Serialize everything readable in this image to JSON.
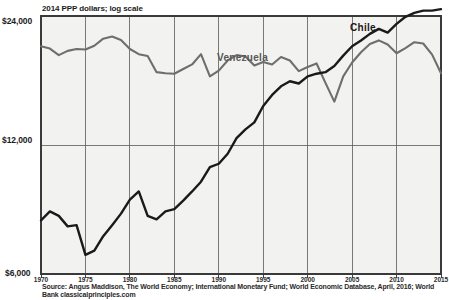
{
  "chart_data": {
    "type": "line",
    "title": "",
    "subtitle": "2014 PPP dollars; log scale",
    "xlabel": "",
    "ylabel": "",
    "scale": "log",
    "grid": true,
    "legend_position": "inline-annotation",
    "xlim": [
      1970,
      2015
    ],
    "ylim": [
      6000,
      24000
    ],
    "ytick_labels": [
      "$24,000",
      "$12,000",
      "$6,000"
    ],
    "ytick_values": [
      24000,
      12000,
      6000
    ],
    "xtick_labels": [
      "1970",
      "1975",
      "1980",
      "1985",
      "1990",
      "1995",
      "2000",
      "2005",
      "2010",
      "2015"
    ],
    "xtick_values": [
      1970,
      1975,
      1980,
      1985,
      1990,
      1995,
      2000,
      2005,
      2010,
      2015
    ],
    "x": [
      1970,
      1971,
      1972,
      1973,
      1974,
      1975,
      1976,
      1977,
      1978,
      1979,
      1980,
      1981,
      1982,
      1983,
      1984,
      1985,
      1986,
      1987,
      1988,
      1989,
      1990,
      1991,
      1992,
      1993,
      1994,
      1995,
      1996,
      1997,
      1998,
      1999,
      2000,
      2001,
      2002,
      2003,
      2004,
      2005,
      2006,
      2007,
      2008,
      2009,
      2010,
      2011,
      2012,
      2013,
      2014,
      2015
    ],
    "series": [
      {
        "name": "Venezuela",
        "color": "#6e6e6e",
        "values": [
          20400,
          20150,
          19450,
          19900,
          20100,
          20050,
          20450,
          21250,
          21500,
          21100,
          20100,
          19550,
          19350,
          17750,
          17650,
          17600,
          18050,
          18500,
          19550,
          17350,
          17900,
          18900,
          19450,
          19300,
          18400,
          18750,
          18500,
          19250,
          18900,
          17850,
          18250,
          18600,
          16750,
          15150,
          17350,
          18700,
          19750,
          20650,
          21050,
          20600,
          19650,
          20200,
          20850,
          20700,
          19500,
          17650
        ]
      },
      {
        "name": "Chile",
        "color": "#1a1a1a",
        "values": [
          8000,
          8400,
          8200,
          7750,
          7800,
          6650,
          6800,
          7350,
          7800,
          8300,
          8950,
          9350,
          8200,
          8050,
          8400,
          8500,
          8900,
          9350,
          9850,
          10650,
          10850,
          11450,
          12450,
          13050,
          13550,
          14800,
          15700,
          16450,
          16900,
          16700,
          17350,
          17600,
          17750,
          18350,
          19400,
          20400,
          21050,
          21800,
          22400,
          21950,
          23000,
          23900,
          24400,
          24700,
          24700,
          24900
        ]
      }
    ],
    "annotations": [
      {
        "text": "Venezuela",
        "x": 1994,
        "y": 21000
      },
      {
        "text": "Chile",
        "x": 2007,
        "y": 23500
      }
    ],
    "source": "Source:  Angus Maddison, The World Economy; International Monetary Fund; World Economic Database, April, 2016; World Bank classicalprinciples.com"
  },
  "plot": {
    "background": "#f2f2f0",
    "border_color": "#3a3a3a",
    "grid_color": "#5a5a5a"
  }
}
